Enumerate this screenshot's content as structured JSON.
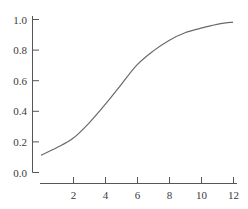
{
  "chart_data": {
    "type": "line",
    "title": "",
    "xlabel": "",
    "ylabel": "",
    "xlim": [
      0,
      12
    ],
    "ylim": [
      0.0,
      1.0
    ],
    "grid": false,
    "legend": null,
    "x_ticks": [
      2,
      4,
      6,
      8,
      10,
      12
    ],
    "x_tick_labels": [
      "2",
      "4",
      "6",
      "8",
      "10",
      "12"
    ],
    "y_ticks": [
      0.0,
      0.2,
      0.4,
      0.6,
      0.8,
      1.0
    ],
    "y_tick_labels": [
      "0.0",
      "0.2",
      "0.4",
      "0.6",
      "0.8",
      "1.0"
    ],
    "series": [
      {
        "name": "curve",
        "color": "#6a6a6a",
        "x": [
          0,
          1,
          2,
          3,
          4,
          5,
          6,
          7,
          8,
          9,
          10,
          11,
          12
        ],
        "y": [
          0.11,
          0.16,
          0.22,
          0.32,
          0.44,
          0.57,
          0.7,
          0.79,
          0.86,
          0.91,
          0.94,
          0.965,
          0.98
        ]
      }
    ]
  }
}
